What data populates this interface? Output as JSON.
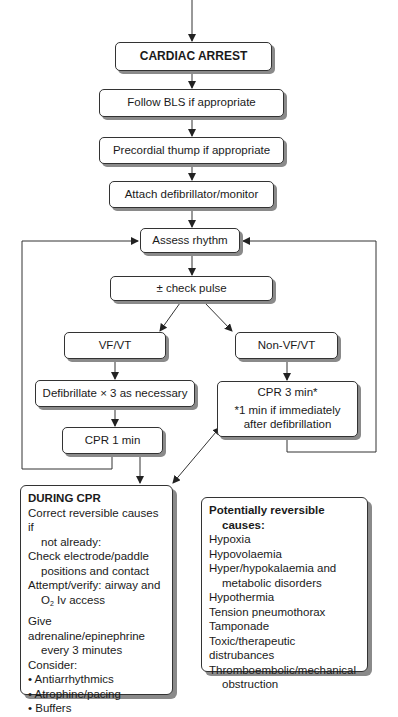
{
  "flowchart": {
    "cardiac_arrest": "CARDIAC ARREST",
    "follow_bls": "Follow BLS if appropriate",
    "precordial_thump": "Precordial thump if appropriate",
    "attach_defib": "Attach defibrillator/monitor",
    "assess_rhythm": "Assess rhythm",
    "check_pulse": "± check pulse",
    "vf_vt": "VF/VT",
    "non_vf_vt": "Non-VF/VT",
    "defibrillate": "Defibrillate × 3 as necessary",
    "cpr_1min": "CPR 1 min",
    "cpr_3min": "CPR 3 min*",
    "cpr_3min_note_1": "*1 min if immediately",
    "cpr_3min_note_2": "after defibrillation"
  },
  "during_cpr": {
    "heading": "DURING CPR",
    "item1_a": "Correct reversible causes if",
    "item1_b": "not already:",
    "item2_a": "Check electrode/paddle",
    "item2_b": "positions and contact",
    "item3_a": "Attempt/verify: airway and",
    "item3_b_pre": "O",
    "item3_b_sub": "2",
    "item3_b_post": " Iv access",
    "item4_a": "Give adrenaline/epinephrine",
    "item4_b": "every 3 minutes",
    "consider": "Consider:",
    "bullets": [
      "• Antiarrhythmics",
      "• Atrophine/pacing",
      "• Buffers"
    ]
  },
  "reversible_causes": {
    "heading_a": "Potentially reversible",
    "heading_b": "causes:",
    "items": [
      "Hypoxia",
      "Hypovolaemia",
      "Hyper/hypokalaemia and",
      "metabolic disorders",
      "Hypothermia",
      "Tension pneumothorax",
      "Tamponade",
      "Toxic/therapeutic distrubances",
      "Thromboembolic/mechanical",
      "obstruction"
    ]
  },
  "colors": {
    "line": "#333333",
    "shadow": "#8a8a8a",
    "box_fill": "#ffffff"
  }
}
